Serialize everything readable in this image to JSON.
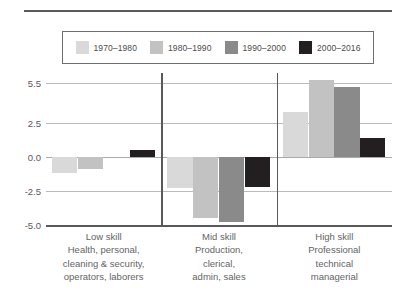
{
  "chart_data": {
    "type": "bar",
    "title": "",
    "subtitle": "",
    "xlabel": "",
    "ylabel": "",
    "ylim": [
      -5.0,
      6.2
    ],
    "grid": true,
    "legend_position": "top",
    "yticks": [
      "5.5",
      "2.5",
      "0.0",
      "-2.5",
      "-5.0"
    ],
    "ytick_values": [
      5.5,
      2.5,
      0.0,
      -2.5,
      -5.0
    ],
    "categories": [
      "Low skill",
      "Mid skill",
      "High skill"
    ],
    "category_sublabels": [
      [
        "Health, personal,",
        "cleaning & security,",
        "operators, laborers"
      ],
      [
        "Production,",
        "clerical,",
        "admin, sales"
      ],
      [
        "Professional",
        "technical",
        "managerial"
      ]
    ],
    "series": [
      {
        "name": "1970–1980",
        "color": "#d9d9d9",
        "values": [
          -1.2,
          -2.3,
          3.3
        ]
      },
      {
        "name": "1980–1990",
        "color": "#c2c2c2",
        "values": [
          -0.9,
          -4.5,
          5.7
        ]
      },
      {
        "name": "1990–2000",
        "color": "#8a8a8a",
        "values": [
          0.0,
          -4.8,
          5.2
        ]
      },
      {
        "name": "2000–2016",
        "color": "#231f20",
        "values": [
          0.55,
          -2.2,
          1.4
        ]
      }
    ]
  },
  "legend": {
    "items": [
      {
        "label": "1970–1980"
      },
      {
        "label": "1980–1990"
      },
      {
        "label": "1990–2000"
      },
      {
        "label": "2000–2016"
      }
    ]
  },
  "axis": {
    "yticks": [
      {
        "label": "5.5"
      },
      {
        "label": "2.5"
      },
      {
        "label": "0.0"
      },
      {
        "label": "-2.5"
      },
      {
        "label": "-5.0"
      }
    ]
  },
  "categories": [
    {
      "title": "Low skill",
      "lines": [
        "Health, personal,",
        "cleaning & security,",
        "operators, laborers"
      ]
    },
    {
      "title": "Mid skill",
      "lines": [
        "Production,",
        "clerical,",
        "admin, sales"
      ]
    },
    {
      "title": "High skill",
      "lines": [
        "Professional",
        "technical",
        "managerial"
      ]
    }
  ]
}
